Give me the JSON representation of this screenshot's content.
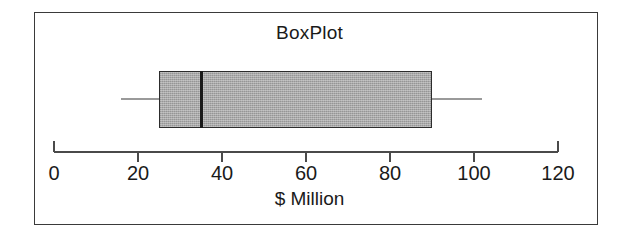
{
  "chart_data": {
    "type": "box",
    "title": "BoxPlot",
    "xlabel": "$ Million",
    "ylabel": "",
    "orientation": "horizontal",
    "xlim": [
      0,
      120
    ],
    "grid": false,
    "legend": null,
    "tick_labels": [
      "0",
      "20",
      "40",
      "60",
      "80",
      "100",
      "120"
    ],
    "ticks": [
      0,
      20,
      40,
      60,
      80,
      100,
      120
    ],
    "categories": [
      "$ Million"
    ],
    "series": [
      {
        "name": "$ Million",
        "min": 16,
        "q1": 25,
        "median": 35,
        "q3": 90,
        "max": 102,
        "outliers": []
      }
    ],
    "colors": {
      "box_fill": "#a9a9a9",
      "box_edge": "#2c2c2c",
      "median": "#1a1a1a",
      "whisker": "#9a9a9a",
      "axis": "#4a4a4a",
      "frame": "#3a3a3a",
      "text": "#1a1a1a",
      "background": "#ffffff"
    }
  }
}
